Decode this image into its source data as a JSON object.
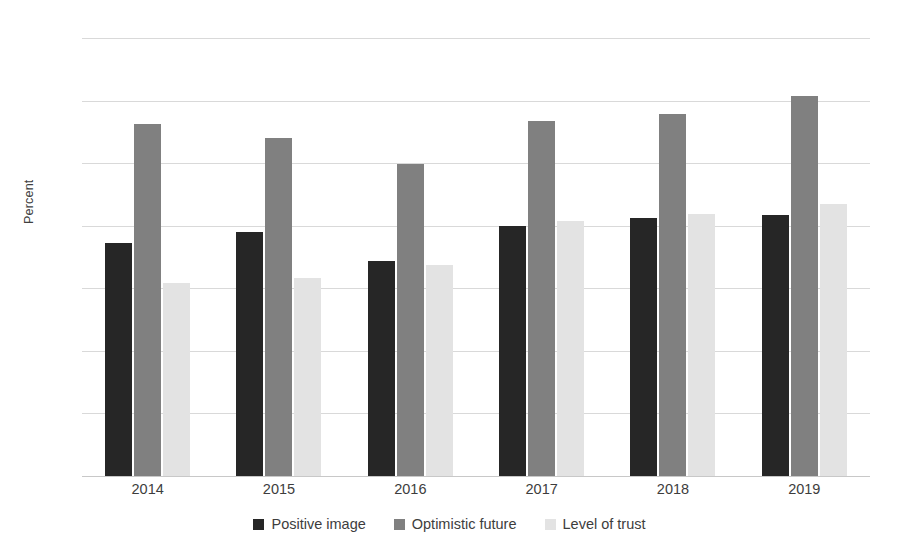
{
  "chart_data": {
    "type": "bar",
    "title": "",
    "subtitle": "",
    "xlabel": "",
    "ylabel": "Percent",
    "ylim": [
      0,
      70
    ],
    "yticks": [
      0,
      10,
      20,
      30,
      40,
      50,
      60,
      70
    ],
    "grid": true,
    "legend_position": "bottom",
    "categories": [
      "2014",
      "2015",
      "2016",
      "2017",
      "2018",
      "2019"
    ],
    "series": [
      {
        "name": "Positive image",
        "color": "#262626",
        "values": [
          37.2,
          39.0,
          34.3,
          39.9,
          41.3,
          41.7
        ]
      },
      {
        "name": "Optimistic future",
        "color": "#808080",
        "values": [
          56.2,
          54.1,
          49.8,
          56.8,
          57.8,
          60.7
        ]
      },
      {
        "name": "Level of trust",
        "color": "#e3e3e3",
        "values": [
          30.9,
          31.6,
          33.7,
          40.7,
          41.8,
          43.4
        ]
      }
    ]
  }
}
